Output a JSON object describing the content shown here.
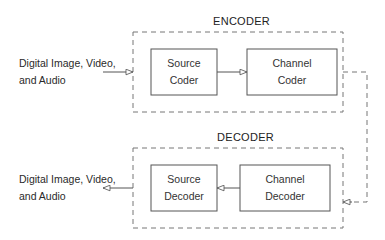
{
  "encoder": {
    "title": "ENCODER",
    "input_label_line1": "Digital Image, Video,",
    "input_label_line2": "and Audio",
    "blocks": [
      {
        "line1": "Source",
        "line2": "Coder"
      },
      {
        "line1": "Channel",
        "line2": "Coder"
      }
    ]
  },
  "decoder": {
    "title": "DECODER",
    "output_label_line1": "Digital Image, Video,",
    "output_label_line2": "and Audio",
    "blocks": [
      {
        "line1": "Source",
        "line2": "Decoder"
      },
      {
        "line1": "Channel",
        "line2": "Decoder"
      }
    ]
  },
  "colors": {
    "line": "#555555",
    "dash": "#777777"
  }
}
